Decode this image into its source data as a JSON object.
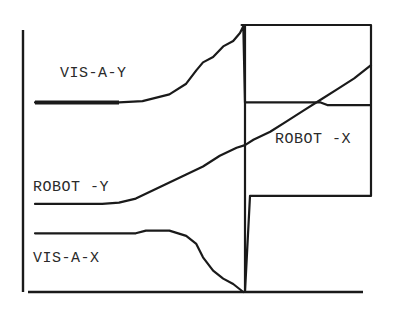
{
  "figure": {
    "labels": {
      "vis_a_y": "VIS-A-Y",
      "robot_x": "ROBOT -X",
      "robot_y": "ROBOT -Y",
      "vis_a_x": "VIS-A-X"
    },
    "colors": {
      "ink": "#1a1a1a",
      "text": "#2a2a2a",
      "background": "#ffffff"
    }
  },
  "chart_data": {
    "type": "line",
    "title": "",
    "xlabel": "",
    "ylabel": "",
    "grid": false,
    "x_range": [
      0,
      100
    ],
    "y_range": [
      0,
      100
    ],
    "series": [
      {
        "name": "VIS-A-Y",
        "points": [
          [
            0,
            71
          ],
          [
            25,
            71
          ],
          [
            32,
            71.5
          ],
          [
            40,
            74
          ],
          [
            45,
            78
          ],
          [
            48,
            83
          ],
          [
            50,
            86
          ],
          [
            53,
            88
          ],
          [
            56,
            92
          ],
          [
            59,
            94
          ],
          [
            61,
            97
          ],
          [
            62,
            99.5
          ],
          [
            62.5,
            71
          ],
          [
            67,
            71
          ],
          [
            85,
            71
          ],
          [
            87,
            70
          ],
          [
            100,
            70
          ]
        ]
      },
      {
        "name": "ROBOT-Y",
        "points": [
          [
            0,
            33
          ],
          [
            20,
            33
          ],
          [
            25,
            33.5
          ],
          [
            30,
            35
          ],
          [
            35,
            38
          ],
          [
            40,
            41
          ],
          [
            45,
            44
          ],
          [
            50,
            47
          ],
          [
            55,
            51
          ],
          [
            60,
            54
          ],
          [
            62.5,
            55
          ],
          [
            65,
            57
          ],
          [
            70,
            60
          ],
          [
            75,
            64
          ],
          [
            80,
            68
          ],
          [
            85,
            72
          ],
          [
            90,
            76
          ],
          [
            95,
            80
          ],
          [
            100,
            85
          ]
        ]
      },
      {
        "name": "VIS-A-X",
        "points": [
          [
            0,
            22
          ],
          [
            30,
            22
          ],
          [
            33,
            23
          ],
          [
            40,
            23
          ],
          [
            45,
            21
          ],
          [
            48,
            18
          ],
          [
            50,
            13
          ],
          [
            53,
            8
          ],
          [
            56,
            5
          ],
          [
            59,
            3
          ],
          [
            62,
            0
          ]
        ]
      },
      {
        "name": "ROBOT-X (step)",
        "points": [
          [
            61.5,
            100
          ],
          [
            63,
            100
          ],
          [
            100,
            100
          ],
          [
            100,
            36
          ],
          [
            64,
            36
          ],
          [
            62.5,
            0
          ],
          [
            62.5,
            100
          ]
        ]
      }
    ],
    "annotations": [
      "VIS-A-Y",
      "ROBOT -X",
      "ROBOT -Y",
      "VIS-A-X"
    ]
  }
}
